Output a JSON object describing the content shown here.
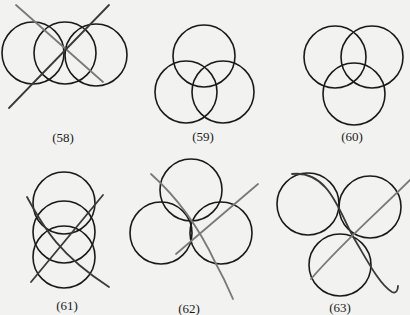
{
  "figures": [
    {
      "id": "58",
      "label": "(58)",
      "circles": 3,
      "arrangement": "horizontal-row",
      "strokes": 2
    },
    {
      "id": "59",
      "label": "(59)",
      "circles": 3,
      "arrangement": "triangle-apex-up",
      "strokes": 0
    },
    {
      "id": "60",
      "label": "(60)",
      "circles": 3,
      "arrangement": "triangle-apex-down",
      "strokes": 0
    },
    {
      "id": "61",
      "label": "(61)",
      "circles": 3,
      "arrangement": "vertical-stack",
      "strokes": 2
    },
    {
      "id": "62",
      "label": "(62)",
      "circles": 3,
      "arrangement": "triangle-apex-up",
      "strokes": 2
    },
    {
      "id": "63",
      "label": "(63)",
      "circles": 3,
      "arrangement": "triangle-apex-down",
      "strokes": 2
    }
  ]
}
